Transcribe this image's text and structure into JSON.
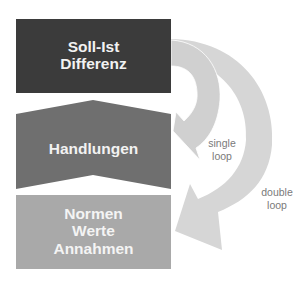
{
  "diagram": {
    "boxes": [
      {
        "id": "soll-ist",
        "lines": [
          "Soll-Ist",
          "Differenz"
        ],
        "color": "#3b3b3b"
      },
      {
        "id": "handlungen",
        "lines": [
          "Handlungen"
        ],
        "color": "#6f6f6f"
      },
      {
        "id": "normen",
        "lines": [
          "Normen",
          "Werte",
          "Annahmen"
        ],
        "color": "#a9a9a9"
      }
    ],
    "arrows": [
      {
        "id": "single-loop",
        "label_lines": [
          "single",
          "loop"
        ],
        "color": "#d6d6d6"
      },
      {
        "id": "double-loop",
        "label_lines": [
          "double",
          "loop"
        ],
        "color": "#d6d6d6"
      }
    ],
    "label_color": "#7a7a7a"
  }
}
